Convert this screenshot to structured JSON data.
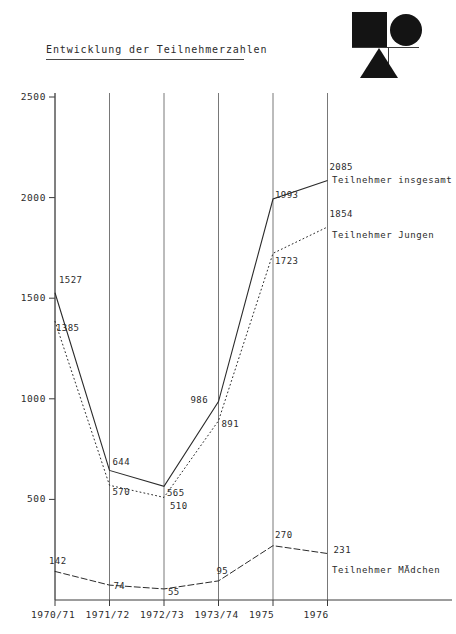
{
  "logo": {
    "square": "black-square",
    "circle": "black-circle",
    "triangle": "black-triangle"
  },
  "header": {
    "title": "Entwicklung der Teilnehmerzahlen"
  },
  "chart_data": {
    "type": "line",
    "title": "Entwicklung der Teilnehmerzahlen",
    "xlabel": "",
    "ylabel": "",
    "categories": [
      "1970/71",
      "1971/72",
      "1972/73",
      "1973/74",
      "1975",
      "1976"
    ],
    "yticks": [
      500,
      1000,
      1500,
      2000,
      2500
    ],
    "ylim": [
      0,
      2600
    ],
    "grid": "vertical",
    "legend": "inline-right",
    "series": [
      {
        "name": "Teilnehmer insgesamt",
        "style": "solid",
        "values": [
          1527,
          644,
          565,
          986,
          1993,
          2085
        ],
        "labels": [
          "1527",
          "644",
          "565",
          "986",
          "1993",
          "2085"
        ]
      },
      {
        "name": "Teilnehmer Jungen",
        "style": "dotted",
        "values": [
          1385,
          570,
          510,
          891,
          1723,
          1854
        ],
        "labels": [
          "1385",
          "570",
          "510",
          "891",
          "1723",
          "1854"
        ]
      },
      {
        "name": "Teilnehmer MÄdchen",
        "style": "dashdot",
        "values": [
          142,
          74,
          55,
          95,
          270,
          231
        ],
        "labels": [
          "142",
          "74",
          "55",
          "95",
          "270",
          "231"
        ]
      }
    ]
  }
}
